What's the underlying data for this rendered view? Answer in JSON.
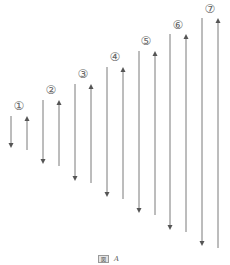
{
  "diagram": {
    "stroke_color": "#7a7a7a",
    "label_color": "#666666",
    "pairs": [
      {
        "label": "①",
        "label_x": 19,
        "label_y": 106,
        "down": {
          "x": 11,
          "y1": 116,
          "y2": 147
        },
        "up": {
          "x": 27,
          "y1": 117,
          "y2": 150
        }
      },
      {
        "label": "②",
        "label_x": 51,
        "label_y": 90,
        "down": {
          "x": 43,
          "y1": 100,
          "y2": 163
        },
        "up": {
          "x": 59,
          "y1": 101,
          "y2": 166
        }
      },
      {
        "label": "③",
        "label_x": 83,
        "label_y": 74,
        "down": {
          "x": 75,
          "y1": 84,
          "y2": 180
        },
        "up": {
          "x": 91,
          "y1": 85,
          "y2": 183
        }
      },
      {
        "label": "④",
        "label_x": 115,
        "label_y": 57,
        "down": {
          "x": 107,
          "y1": 67,
          "y2": 196
        },
        "up": {
          "x": 123,
          "y1": 68,
          "y2": 199
        }
      },
      {
        "label": "⑤",
        "label_x": 146,
        "label_y": 41,
        "down": {
          "x": 139,
          "y1": 51,
          "y2": 212
        },
        "up": {
          "x": 155,
          "y1": 52,
          "y2": 215
        }
      },
      {
        "label": "⑥",
        "label_x": 178,
        "label_y": 25,
        "down": {
          "x": 170,
          "y1": 34,
          "y2": 229
        },
        "up": {
          "x": 186,
          "y1": 35,
          "y2": 232
        }
      },
      {
        "label": "⑦",
        "label_x": 210,
        "label_y": 9,
        "down": {
          "x": 202,
          "y1": 18,
          "y2": 245
        },
        "up": {
          "x": 218,
          "y1": 19,
          "y2": 248
        }
      }
    ]
  },
  "caption": {
    "tag": "図",
    "letter": "A"
  }
}
